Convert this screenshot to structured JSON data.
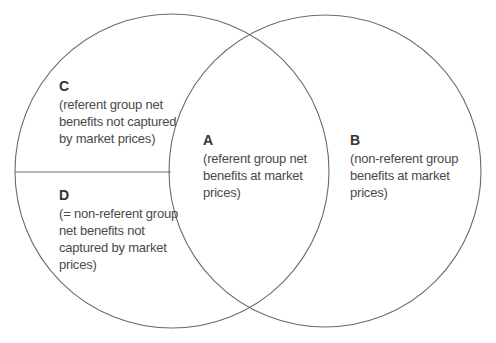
{
  "diagram": {
    "type": "venn",
    "colors": {
      "stroke": "#6b6b6b",
      "text": "#4a4a4a"
    },
    "circles": [
      {
        "name": "left-circle",
        "cx": 172,
        "cy": 171,
        "r": 157
      },
      {
        "name": "right-circle",
        "cx": 325,
        "cy": 171,
        "r": 156
      }
    ],
    "divider": {
      "x1": 15,
      "y1": 172,
      "x2": 171,
      "y2": 172
    },
    "regions": {
      "C": {
        "letter": "C",
        "description": "(referent group net\nbenefits not captured\nby market prices)"
      },
      "D": {
        "letter": "D",
        "description": "(= non-referent group\nnet benefits not\ncaptured by market\nprices)"
      },
      "A": {
        "letter": "A",
        "description": "(referent group net\nbenefits at market\nprices)"
      },
      "B": {
        "letter": "B",
        "description": "(non-referent group\nbenefits at market\nprices)"
      }
    }
  }
}
